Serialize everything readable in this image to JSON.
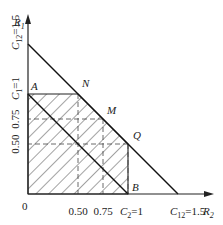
{
  "diagram": {
    "type": "capacity-region",
    "axes": {
      "x_label": "R",
      "x_label_sub": "2",
      "y_label": "R",
      "y_label_sub": "1",
      "origin_label": "0"
    },
    "x_ticks": [
      {
        "value": 0.5,
        "label": "0.50"
      },
      {
        "value": 0.75,
        "label": "0.75"
      },
      {
        "value": 1.0,
        "label_main": "C",
        "label_sub": "2",
        "label_rest": "=1"
      },
      {
        "value": 1.5,
        "label_main": "C",
        "label_sub": "12",
        "label_rest": "=1.5"
      }
    ],
    "y_ticks": [
      {
        "value": 0.5,
        "label": "0.50"
      },
      {
        "value": 0.75,
        "label": "0.75"
      },
      {
        "value": 1.0,
        "label_main": "C",
        "label_sub": "1",
        "label_rest": "=1"
      },
      {
        "value": 1.5,
        "label_main": "C",
        "label_sub": "12",
        "label_rest": "=1.5"
      }
    ],
    "points": [
      {
        "name": "A",
        "x": 0,
        "y": 1
      },
      {
        "name": "N",
        "x": 0.5,
        "y": 1
      },
      {
        "name": "M",
        "x": 0.75,
        "y": 0.75
      },
      {
        "name": "Q",
        "x": 1,
        "y": 0.5
      },
      {
        "name": "B",
        "x": 1,
        "y": 0
      }
    ],
    "lines": [
      {
        "name": "sum-rate-line",
        "from": [
          0,
          1.5
        ],
        "to": [
          1.5,
          0
        ]
      },
      {
        "name": "A-B-line",
        "from": [
          0,
          1
        ],
        "to": [
          1,
          0
        ]
      }
    ],
    "hatched_region": [
      [
        0,
        0
      ],
      [
        0,
        1
      ],
      [
        0.5,
        1
      ],
      [
        1,
        0.5
      ],
      [
        1,
        0
      ]
    ],
    "dashed_lines": [
      {
        "from": [
          0.5,
          1
        ],
        "to": [
          0.5,
          0
        ]
      },
      {
        "from": [
          0.75,
          0.75
        ],
        "to": [
          0.75,
          0
        ]
      },
      {
        "from": [
          0.75,
          0.75
        ],
        "to": [
          0,
          0.75
        ]
      },
      {
        "from": [
          1,
          0.5
        ],
        "to": [
          0,
          0.5
        ]
      },
      {
        "from": [
          1,
          0.5
        ],
        "to": [
          1,
          0
        ]
      }
    ]
  }
}
